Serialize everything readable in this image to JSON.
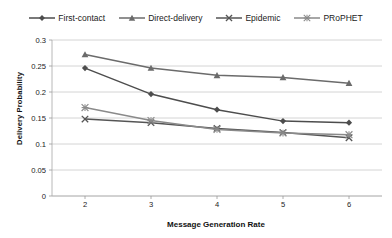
{
  "chart_data": {
    "type": "line",
    "title": "",
    "xlabel": "Message Generation Rate",
    "ylabel": "Delivery Probability",
    "categories": [
      2,
      3,
      4,
      5,
      6
    ],
    "x": [
      2,
      3,
      4,
      5,
      6
    ],
    "xtick_labels": [
      "2",
      "3",
      "4",
      "5",
      "6"
    ],
    "ytick_labels": [
      "0",
      "0.05",
      "0.1",
      "0.15",
      "0.2",
      "0.25",
      "0.3"
    ],
    "ytick_values": [
      0,
      0.05,
      0.1,
      0.15,
      0.2,
      0.25,
      0.3
    ],
    "ylim": [
      0,
      0.3
    ],
    "xlim": [
      1.5,
      6.5
    ],
    "grid": true,
    "legend_position": "top",
    "series": [
      {
        "name": "First-contact",
        "marker": "diamond",
        "color": "#4d4d4d",
        "values": [
          0.246,
          0.196,
          0.166,
          0.144,
          0.141
        ]
      },
      {
        "name": "Direct-delivery",
        "marker": "triangle",
        "color": "#6b6b6b",
        "values": [
          0.272,
          0.246,
          0.232,
          0.228,
          0.217
        ]
      },
      {
        "name": "Epidemic",
        "marker": "cross",
        "color": "#555555",
        "values": [
          0.148,
          0.141,
          0.13,
          0.122,
          0.112
        ]
      },
      {
        "name": "PRoPHET",
        "marker": "star",
        "color": "#8a8a8a",
        "values": [
          0.17,
          0.145,
          0.128,
          0.121,
          0.118
        ]
      }
    ]
  }
}
